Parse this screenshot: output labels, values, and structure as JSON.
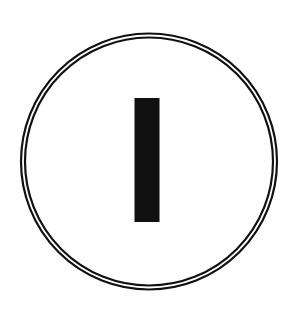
{
  "symbol": {
    "name": "power-on-symbol",
    "description": "IEC 60417-5007 'On' symbol: vertical bar inside a double-ring circle",
    "colors": {
      "stroke": "#111111",
      "fill": "#111111",
      "background": "#ffffff"
    }
  }
}
